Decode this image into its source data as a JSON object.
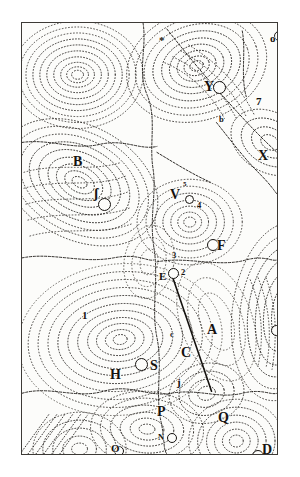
{
  "figure": {
    "kind": "engraving",
    "ink_color": "#15120f",
    "paper_color": "#fcfcfa",
    "frame_color": "#3d3a36",
    "background_color": "#ffffff"
  },
  "labels": [
    {
      "id": "label-star-top-right",
      "text": "o",
      "x": 248,
      "y": 10,
      "size": "mid"
    },
    {
      "id": "label-mark-top",
      "text": "*",
      "x": 137,
      "y": 12,
      "size": "mid"
    },
    {
      "id": "label-Y",
      "text": "Y",
      "x": 182,
      "y": 57,
      "size": "big"
    },
    {
      "id": "label-b",
      "text": "b",
      "x": 197,
      "y": 92,
      "size": "small"
    },
    {
      "id": "label-7",
      "text": "7",
      "x": 234,
      "y": 73,
      "size": "mid"
    },
    {
      "id": "label-X",
      "text": "X",
      "x": 236,
      "y": 126,
      "size": "big"
    },
    {
      "id": "label-B",
      "text": "B",
      "x": 51,
      "y": 132,
      "size": "big"
    },
    {
      "id": "label-long-s",
      "text": "ʃ",
      "x": 72,
      "y": 164,
      "size": "big"
    },
    {
      "id": "label-V",
      "text": "V",
      "x": 148,
      "y": 165,
      "size": "big"
    },
    {
      "id": "label-5",
      "text": "5",
      "x": 161,
      "y": 158,
      "size": "tiny"
    },
    {
      "id": "label-4",
      "text": "4",
      "x": 175,
      "y": 178,
      "size": "small"
    },
    {
      "id": "label-F",
      "text": "F",
      "x": 195,
      "y": 216,
      "size": "big"
    },
    {
      "id": "label-3",
      "text": "3",
      "x": 150,
      "y": 228,
      "size": "small"
    },
    {
      "id": "label-E",
      "text": "E",
      "x": 137,
      "y": 248,
      "size": "mid"
    },
    {
      "id": "label-2",
      "text": "2",
      "x": 159,
      "y": 245,
      "size": "small"
    },
    {
      "id": "label-1",
      "text": "1",
      "x": 60,
      "y": 287,
      "size": "mid"
    },
    {
      "id": "label-A",
      "text": "A",
      "x": 185,
      "y": 300,
      "size": "big"
    },
    {
      "id": "label-L",
      "text": "L",
      "x": 262,
      "y": 302,
      "size": "big"
    },
    {
      "id": "label-c",
      "text": "c",
      "x": 148,
      "y": 307,
      "size": "small"
    },
    {
      "id": "label-C",
      "text": "C",
      "x": 159,
      "y": 323,
      "size": "big"
    },
    {
      "id": "label-S",
      "text": "S",
      "x": 128,
      "y": 336,
      "size": "big"
    },
    {
      "id": "label-H",
      "text": "H",
      "x": 88,
      "y": 345,
      "size": "big"
    },
    {
      "id": "label-j",
      "text": "j",
      "x": 155,
      "y": 354,
      "size": "mid"
    },
    {
      "id": "label-P",
      "text": "P",
      "x": 135,
      "y": 382,
      "size": "big"
    },
    {
      "id": "label-Q",
      "text": "Q",
      "x": 196,
      "y": 388,
      "size": "big"
    },
    {
      "id": "label-N",
      "text": "N",
      "x": 136,
      "y": 410,
      "size": "small"
    },
    {
      "id": "label-O-left",
      "text": "O",
      "x": 89,
      "y": 420,
      "size": "mid"
    },
    {
      "id": "label-R",
      "text": "R",
      "x": 155,
      "y": 437,
      "size": "big"
    },
    {
      "id": "label-D",
      "text": "D",
      "x": 240,
      "y": 420,
      "size": "big"
    }
  ],
  "stars": [
    {
      "id": "star-top-right",
      "cx": 256,
      "cy": 12,
      "r": 4.0
    },
    {
      "id": "star-Y",
      "cx": 196,
      "cy": 63,
      "r": 5.5
    },
    {
      "id": "star-long-s",
      "cx": 81,
      "cy": 180,
      "r": 5.5
    },
    {
      "id": "star-V",
      "cx": 166,
      "cy": 175,
      "r": 3.5
    },
    {
      "id": "star-F",
      "cx": 190,
      "cy": 221,
      "r": 5.0
    },
    {
      "id": "star-E",
      "cx": 150,
      "cy": 249,
      "r": 4.5
    },
    {
      "id": "star-L",
      "cx": 253,
      "cy": 306,
      "r": 4.5
    },
    {
      "id": "star-S",
      "cx": 118,
      "cy": 340,
      "r": 5.5
    },
    {
      "id": "star-N",
      "cx": 149,
      "cy": 414,
      "r": 4.0
    },
    {
      "id": "star-O-left",
      "cx": 96,
      "cy": 427,
      "r": 4.0
    },
    {
      "id": "star-D",
      "cx": 235,
      "cy": 432,
      "r": 5.0
    }
  ],
  "comet_path": {
    "id": "comet-trajectory",
    "x1": 152,
    "y1": 256,
    "x2": 191,
    "y2": 370
  }
}
